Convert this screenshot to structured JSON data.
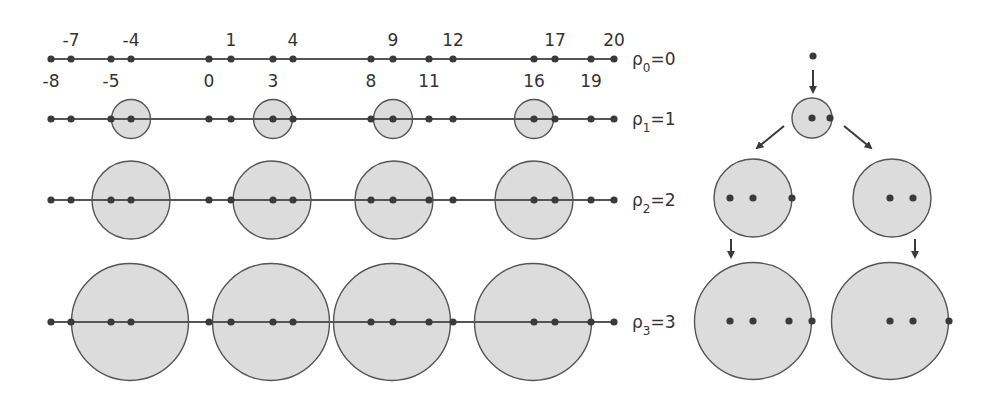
{
  "colors": {
    "line": "#555555",
    "dot": "#3a3a3a",
    "circle_fill": "#dcdcdc",
    "circle_stroke": "#555555",
    "text": "#333333"
  },
  "rows": [
    {
      "label_sym": "ρ",
      "label_sub": "0",
      "label_eq": "=0",
      "y": 59,
      "x_start": 51,
      "x_end": 614,
      "points": [
        51,
        71,
        111,
        131,
        209,
        231,
        273,
        293,
        371,
        393,
        429,
        453,
        534,
        555,
        591,
        614
      ],
      "circles": [],
      "radius": 0
    },
    {
      "label_sym": "ρ",
      "label_sub": "1",
      "label_eq": "=1",
      "y": 119,
      "x_start": 51,
      "x_end": 614,
      "points": [
        51,
        71,
        111,
        131,
        209,
        231,
        273,
        293,
        371,
        393,
        429,
        453,
        534,
        555,
        591,
        614
      ],
      "circles": [
        131,
        273,
        393,
        534
      ],
      "radius": 19.5
    },
    {
      "label_sym": "ρ",
      "label_sub": "2",
      "label_eq": "=2",
      "y": 200,
      "x_start": 51,
      "x_end": 614,
      "points": [
        51,
        71,
        111,
        131,
        209,
        231,
        273,
        293,
        371,
        393,
        429,
        453,
        534,
        555,
        591,
        614
      ],
      "circles": [
        131,
        272,
        394,
        534
      ],
      "radius": 39
    },
    {
      "label_sym": "ρ",
      "label_sub": "3",
      "label_eq": "=3",
      "y": 322,
      "x_start": 51,
      "x_end": 614,
      "points": [
        51,
        71,
        111,
        131,
        209,
        231,
        273,
        293,
        371,
        393,
        429,
        453,
        534,
        555,
        591,
        614
      ],
      "circles": [
        130,
        271,
        392,
        533
      ],
      "radius": 58.5
    }
  ],
  "top_labels": [
    {
      "text": "-7",
      "x": 71
    },
    {
      "text": "-4",
      "x": 131
    },
    {
      "text": "1",
      "x": 231
    },
    {
      "text": "4",
      "x": 293
    },
    {
      "text": "9",
      "x": 393
    },
    {
      "text": "12",
      "x": 453
    },
    {
      "text": "17",
      "x": 555
    },
    {
      "text": "20",
      "x": 614
    }
  ],
  "bottom_labels": [
    {
      "text": "-8",
      "x": 51
    },
    {
      "text": "-5",
      "x": 111
    },
    {
      "text": "0",
      "x": 209
    },
    {
      "text": "3",
      "x": 273
    },
    {
      "text": "8",
      "x": 371
    },
    {
      "text": "11",
      "x": 429
    },
    {
      "text": "16",
      "x": 534
    },
    {
      "text": "19",
      "x": 591
    }
  ],
  "tree": {
    "root_dot": {
      "x": 813,
      "y": 56
    },
    "level1": {
      "cx": 812,
      "cy": 118,
      "r": 20,
      "dots": [
        812,
        830
      ]
    },
    "level2": [
      {
        "cx": 753,
        "cy": 198,
        "r": 39,
        "dots": [
          730,
          753,
          792
        ]
      },
      {
        "cx": 892,
        "cy": 198,
        "r": 39,
        "dots": [
          890,
          913
        ]
      }
    ],
    "level3": [
      {
        "cx": 753,
        "cy": 321,
        "r": 58.5,
        "dots": [
          730,
          753,
          789,
          812
        ]
      },
      {
        "cx": 890,
        "cy": 321,
        "r": 58.5,
        "dots": [
          890,
          913,
          949
        ]
      }
    ],
    "arrows": [
      {
        "x1": 813,
        "y1": 70,
        "x2": 813,
        "y2": 92
      },
      {
        "x1": 784,
        "y1": 126,
        "x2": 757,
        "y2": 148
      },
      {
        "x1": 844,
        "y1": 126,
        "x2": 871,
        "y2": 148
      },
      {
        "x1": 731,
        "y1": 239,
        "x2": 731,
        "y2": 257
      },
      {
        "x1": 915,
        "y1": 239,
        "x2": 915,
        "y2": 257
      }
    ]
  }
}
